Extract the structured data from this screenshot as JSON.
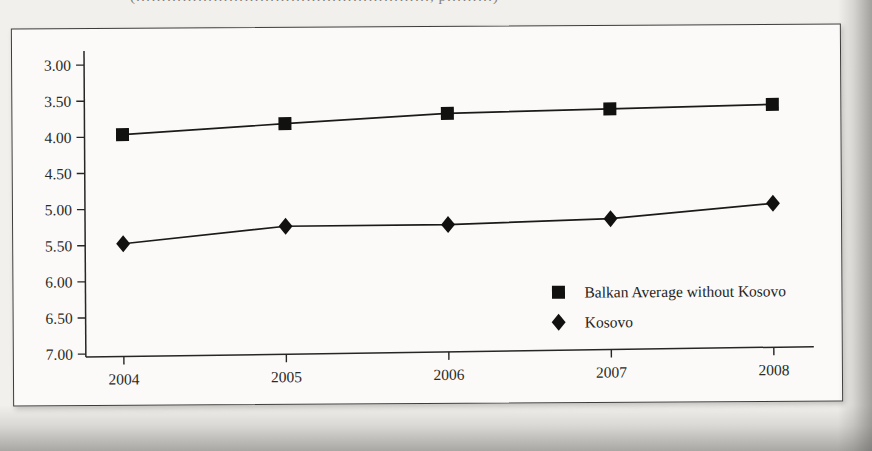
{
  "page": {
    "caption_fragment": "(…………………………………………………, p………)",
    "background_color": "#f2f0ec",
    "frame_color": "#3c3c3a",
    "ink_color": "#1a1a19"
  },
  "chart_data": {
    "type": "line",
    "title": "",
    "subtitle": "",
    "xlabel": "",
    "ylabel": "",
    "categories": [
      "2004",
      "2005",
      "2006",
      "2007",
      "2008"
    ],
    "x": [
      2004,
      2005,
      2006,
      2007,
      2008
    ],
    "series": [
      {
        "name": "Balkan Average without Kosovo",
        "marker": "square",
        "color": "#111110",
        "values": [
          3.97,
          3.85,
          3.74,
          3.71,
          3.68
        ]
      },
      {
        "name": "Kosovo",
        "marker": "diamond",
        "color": "#111110",
        "values": [
          5.48,
          5.27,
          5.28,
          5.23,
          5.05
        ]
      }
    ],
    "ylim": [
      3.0,
      7.0
    ],
    "y_inverted": true,
    "yticks": [
      3.0,
      3.5,
      4.0,
      4.5,
      5.0,
      5.5,
      6.0,
      6.5,
      7.0
    ],
    "ytick_labels": [
      "3.00",
      "3.50",
      "4.00",
      "4.50",
      "5.00",
      "5.50",
      "6.00",
      "6.50",
      "7.00"
    ],
    "xtick_labels": [
      "2004",
      "2005",
      "2006",
      "2007",
      "2008"
    ],
    "grid": false,
    "legend_position": "inside-lower-right",
    "legend": [
      {
        "label": "Balkan Average without Kosovo",
        "marker": "square"
      },
      {
        "label": "Kosovo",
        "marker": "diamond"
      }
    ]
  }
}
